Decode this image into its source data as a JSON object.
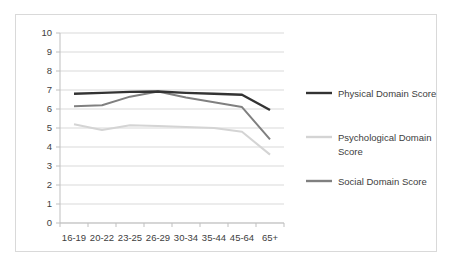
{
  "chart_data": {
    "type": "line",
    "title": "",
    "subtitle": "",
    "xlabel": "",
    "ylabel": "",
    "categories": [
      "16-19",
      "20-22",
      "23-25",
      "26-29",
      "30-34",
      "35-44",
      "45-64",
      "65+"
    ],
    "ylim": [
      0,
      10
    ],
    "y_ticks": [
      "0",
      "1",
      "2",
      "3",
      "4",
      "5",
      "6",
      "7",
      "8",
      "9",
      "10"
    ],
    "grid": true,
    "legend_position": "right",
    "series": [
      {
        "name": "Physical Domain Score",
        "color": "#333333",
        "values": [
          6.8,
          6.85,
          6.9,
          6.92,
          6.85,
          6.8,
          6.75,
          5.95
        ]
      },
      {
        "name": "Psychological Domain Score",
        "color": "#d4d4d4",
        "values": [
          5.2,
          4.9,
          5.15,
          5.1,
          5.05,
          5.0,
          4.8,
          3.6
        ]
      },
      {
        "name": "Social Domain Score",
        "color": "#808080",
        "values": [
          6.15,
          6.2,
          6.65,
          6.92,
          6.6,
          6.35,
          6.1,
          4.4
        ]
      }
    ]
  },
  "legend": {
    "entries": [
      "Physical Domain Score",
      "Psychological Domain Score",
      "Social Domain Score"
    ]
  },
  "colors": {
    "physical": "#333333",
    "psychological": "#d4d4d4",
    "social": "#808080",
    "grid": "#d9d9d9",
    "axis": "#bfbfbf",
    "text": "#404040",
    "border": "#d9d9d9"
  }
}
